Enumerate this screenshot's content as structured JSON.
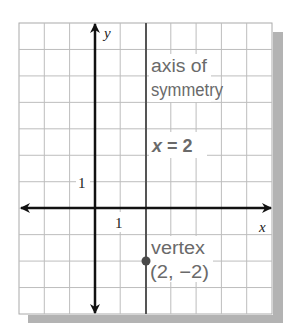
{
  "chart_data": {
    "type": "line",
    "title": "",
    "xlabel": "x",
    "ylabel": "y",
    "xlim": [
      -3,
      7
    ],
    "ylim": [
      -4,
      7
    ],
    "grid": true,
    "grid_step": 1,
    "tick_labels": {
      "x": [
        "1"
      ],
      "y": [
        "1"
      ]
    },
    "series": [
      {
        "name": "axis of symmetry",
        "kind": "vertical-line",
        "x": 2,
        "equation": "x = 2"
      },
      {
        "name": "vertex",
        "kind": "point",
        "x": 2,
        "y": -2
      }
    ],
    "annotations": [
      {
        "text": "axis of",
        "x": 2.2,
        "y": 5.2
      },
      {
        "text": "symmetry",
        "x": 2.2,
        "y": 4.3
      },
      {
        "text": "x = 2",
        "x": 2.2,
        "y": 2.1,
        "bold": true
      },
      {
        "text": "vertex",
        "x": 2.2,
        "y": -1.7
      },
      {
        "text": "(2, −2)",
        "x": 2.2,
        "y": -2.6
      }
    ]
  },
  "labels": {
    "x_axis": "x",
    "y_axis": "y",
    "x_tick": "1",
    "y_tick": "1",
    "axis_line1": "axis of",
    "axis_line2": "symmetry",
    "equation_var": "x",
    "equation_rest": " = 2",
    "vertex_title": "vertex",
    "vertex_coords": "(2, −2)"
  },
  "colors": {
    "grid": "#bdbdbd",
    "axes": "#111111",
    "symmetry_line": "#555555",
    "vertex_point": "#4a4a4a",
    "annotation_text": "#6a6a6a",
    "shadow": "#b3b3b3"
  }
}
